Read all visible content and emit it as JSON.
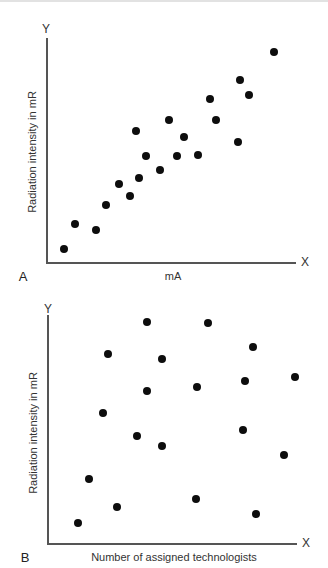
{
  "chart_data": [
    {
      "panel": "A",
      "type": "scatter",
      "title": "",
      "xlabel": "mA",
      "ylabel": "Radiation intensity in mR",
      "x_axis_letter": "X",
      "y_axis_letter": "Y",
      "grid": false,
      "ticks": false,
      "scale_note": "No tick values shown; coordinates are relative 0-100 of axis length",
      "xlim": [
        0,
        100
      ],
      "ylim": [
        0,
        100
      ],
      "points": [
        {
          "x": 6.9,
          "y": 5.8
        },
        {
          "x": 11.1,
          "y": 17.0
        },
        {
          "x": 19.8,
          "y": 14.3
        },
        {
          "x": 23.8,
          "y": 25.6
        },
        {
          "x": 28.8,
          "y": 35.0
        },
        {
          "x": 33.2,
          "y": 29.5
        },
        {
          "x": 37.1,
          "y": 37.6
        },
        {
          "x": 35.9,
          "y": 58.6
        },
        {
          "x": 39.6,
          "y": 47.2
        },
        {
          "x": 45.4,
          "y": 40.9
        },
        {
          "x": 48.9,
          "y": 63.4
        },
        {
          "x": 52.3,
          "y": 47.2
        },
        {
          "x": 55.1,
          "y": 55.9
        },
        {
          "x": 60.8,
          "y": 47.9
        },
        {
          "x": 65.6,
          "y": 72.8
        },
        {
          "x": 68.0,
          "y": 63.4
        },
        {
          "x": 76.7,
          "y": 53.7
        },
        {
          "x": 77.4,
          "y": 81.1
        },
        {
          "x": 81.2,
          "y": 74.6
        },
        {
          "x": 91.2,
          "y": 93.8
        }
      ]
    },
    {
      "panel": "B",
      "type": "scatter",
      "title": "",
      "xlabel": "Number of assigned technologists",
      "ylabel": "Radiation intensity in mR",
      "x_axis_letter": "X",
      "y_axis_letter": "Y",
      "grid": false,
      "ticks": false,
      "scale_note": "No tick values shown; coordinates are relative 0-100 of axis length",
      "xlim": [
        0,
        100
      ],
      "ylim": [
        0,
        100
      ],
      "points": [
        {
          "x": 39.6,
          "y": 96.8
        },
        {
          "x": 64.1,
          "y": 96.4
        },
        {
          "x": 82.2,
          "y": 85.9
        },
        {
          "x": 24.0,
          "y": 82.8
        },
        {
          "x": 45.9,
          "y": 80.7
        },
        {
          "x": 99.1,
          "y": 72.9
        },
        {
          "x": 79.0,
          "y": 71.3
        },
        {
          "x": 59.7,
          "y": 68.7
        },
        {
          "x": 39.9,
          "y": 66.8
        },
        {
          "x": 22.2,
          "y": 57.3
        },
        {
          "x": 78.2,
          "y": 49.9
        },
        {
          "x": 35.6,
          "y": 47.2
        },
        {
          "x": 45.9,
          "y": 42.7
        },
        {
          "x": 94.9,
          "y": 38.9
        },
        {
          "x": 16.5,
          "y": 28.5
        },
        {
          "x": 59.6,
          "y": 19.8
        },
        {
          "x": 27.6,
          "y": 16.0
        },
        {
          "x": 83.5,
          "y": 13.0
        },
        {
          "x": 12.2,
          "y": 9.2
        }
      ]
    }
  ],
  "colors": {
    "dot": "#0d0d0d",
    "axis": "#555555",
    "text": "#333333"
  }
}
